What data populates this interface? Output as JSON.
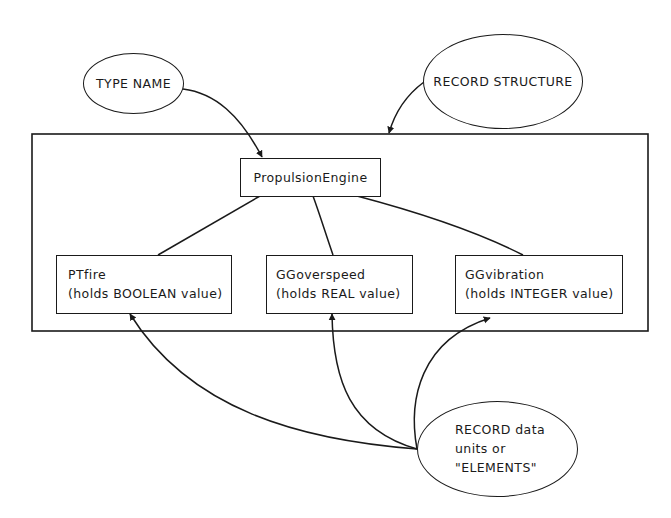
{
  "diagram": {
    "type": "record-structure-diagram",
    "callouts": {
      "type_name": "TYPE NAME",
      "record_structure": "RECORD STRUCTURE",
      "elements": {
        "line1": "RECORD data",
        "line2": "units or",
        "line3": "\"ELEMENTS\""
      }
    },
    "record": {
      "name": "PropulsionEngine",
      "elements": [
        {
          "name": "PTfire",
          "description": "(holds BOOLEAN value)"
        },
        {
          "name": "GGoverspeed",
          "description": "(holds REAL value)"
        },
        {
          "name": "GGvibration",
          "description": "(holds INTEGER value)"
        }
      ]
    },
    "colors": {
      "stroke": "#1a1a1a",
      "background": "#ffffff"
    }
  }
}
